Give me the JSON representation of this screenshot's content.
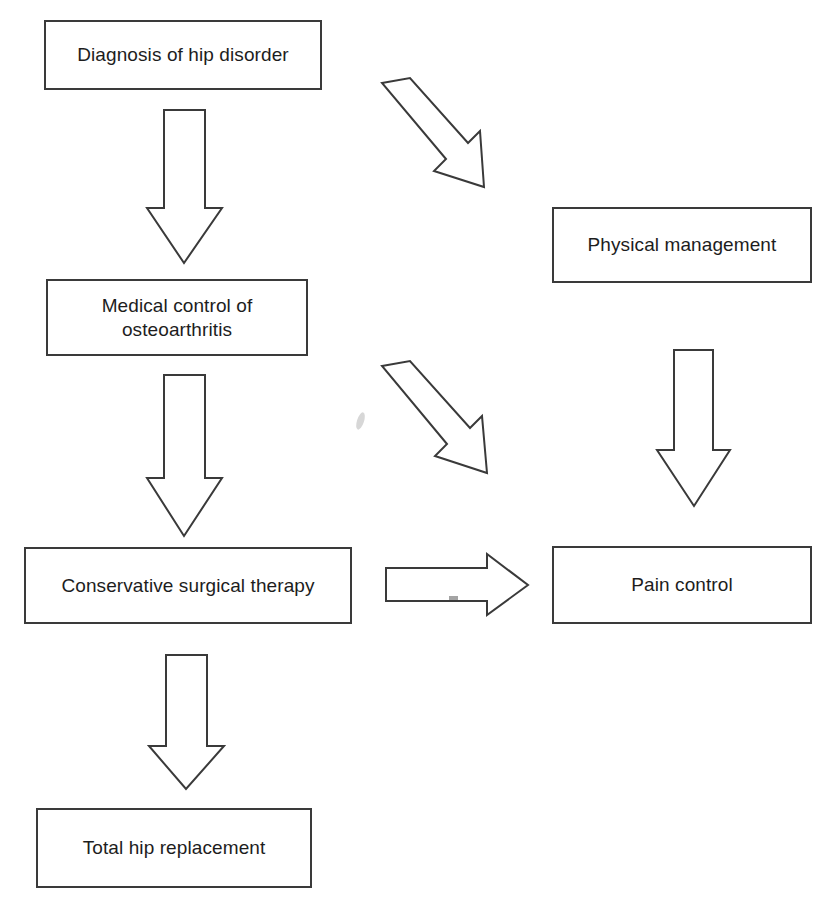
{
  "diagram": {
    "type": "flowchart",
    "background_color": "#ffffff",
    "line_color": "#3a3a3a",
    "text_color": "#1d1d1d",
    "nodes": [
      {
        "id": "diagnosis",
        "label": "Diagnosis of hip disorder",
        "x": 44,
        "y": 20,
        "w": 278,
        "h": 70
      },
      {
        "id": "physical-management",
        "label": "Physical management",
        "x": 552,
        "y": 207,
        "w": 260,
        "h": 76
      },
      {
        "id": "medical-control",
        "label": "Medical control of\nosteoarthritis",
        "x": 46,
        "y": 279,
        "w": 262,
        "h": 77
      },
      {
        "id": "conservative-surgical-therapy",
        "label": "Conservative surgical therapy",
        "x": 24,
        "y": 547,
        "w": 328,
        "h": 77
      },
      {
        "id": "pain-control",
        "label": "Pain control",
        "x": 552,
        "y": 546,
        "w": 260,
        "h": 78
      },
      {
        "id": "total-hip-replacement",
        "label": "Total hip replacement",
        "x": 36,
        "y": 808,
        "w": 276,
        "h": 80
      }
    ],
    "arrows": [
      {
        "id": "diagnosis-to-medical-control",
        "from": "diagnosis",
        "to": "medical-control",
        "direction": "down"
      },
      {
        "id": "diagnosis-to-physical-management",
        "from": "diagnosis",
        "to": "physical-management",
        "direction": "down-right"
      },
      {
        "id": "medical-control-to-conservative-surgical-therapy",
        "from": "medical-control",
        "to": "conservative-surgical-therapy",
        "direction": "down"
      },
      {
        "id": "medical-control-to-pain-control",
        "from": "medical-control",
        "to": "pain-control",
        "direction": "down-right"
      },
      {
        "id": "physical-management-to-pain-control",
        "from": "physical-management",
        "to": "pain-control",
        "direction": "down"
      },
      {
        "id": "conservative-surgical-therapy-to-pain-control",
        "from": "conservative-surgical-therapy",
        "to": "pain-control",
        "direction": "right"
      },
      {
        "id": "conservative-surgical-therapy-to-total-hip-replacement",
        "from": "conservative-surgical-therapy",
        "to": "total-hip-replacement",
        "direction": "down"
      }
    ]
  }
}
